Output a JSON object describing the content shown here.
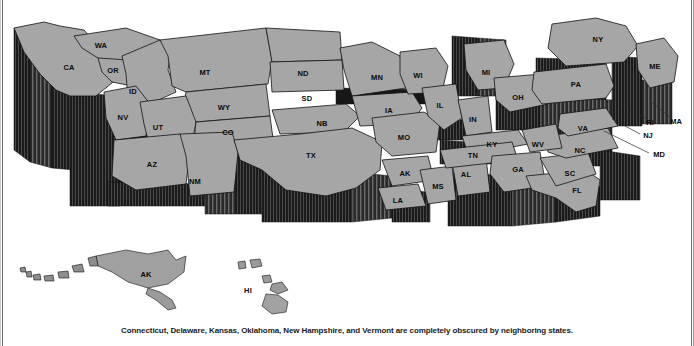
{
  "figure": {
    "caption": "Connecticut, Delaware, Kansas, Oklahoma, New Hampshire, and Vermont are completely obscured by neighboring states.",
    "colors": {
      "state_top_fill": "#a6a6a6",
      "state_side_dark": "#1c1c1c",
      "state_side_mid": "#555555",
      "outline": "#111111",
      "background": "#ffffff",
      "label_text": "#0a0a0a",
      "frame_rule": "#6e6e6e"
    }
  },
  "map": {
    "projection_note": "3D extruded prism map, viewed from the south at a low angle",
    "mainland_labels": [
      {
        "abbr": "WA",
        "x": 101,
        "y": 46
      },
      {
        "abbr": "OR",
        "x": 113,
        "y": 71
      },
      {
        "abbr": "CA",
        "x": 69,
        "y": 68
      },
      {
        "abbr": "ID",
        "x": 133,
        "y": 92
      },
      {
        "abbr": "NV",
        "x": 123,
        "y": 118
      },
      {
        "abbr": "MT",
        "x": 205,
        "y": 73
      },
      {
        "abbr": "WY",
        "x": 224,
        "y": 108
      },
      {
        "abbr": "UT",
        "x": 158,
        "y": 128
      },
      {
        "abbr": "AZ",
        "x": 152,
        "y": 165
      },
      {
        "abbr": "NM",
        "x": 195,
        "y": 182
      },
      {
        "abbr": "CO",
        "x": 228,
        "y": 133
      },
      {
        "abbr": "ND",
        "x": 303,
        "y": 74
      },
      {
        "abbr": "SD",
        "x": 307,
        "y": 99
      },
      {
        "abbr": "NB",
        "x": 322,
        "y": 124
      },
      {
        "abbr": "TX",
        "x": 311,
        "y": 156
      },
      {
        "abbr": "MN",
        "x": 377,
        "y": 78
      },
      {
        "abbr": "IA",
        "x": 389,
        "y": 111
      },
      {
        "abbr": "MO",
        "x": 404,
        "y": 138
      },
      {
        "abbr": "AK",
        "x": 405,
        "y": 174
      },
      {
        "abbr": "LA",
        "x": 398,
        "y": 201
      },
      {
        "abbr": "MS",
        "x": 438,
        "y": 187
      },
      {
        "abbr": "AL",
        "x": 466,
        "y": 175
      },
      {
        "abbr": "WI",
        "x": 418,
        "y": 76
      },
      {
        "abbr": "IL",
        "x": 440,
        "y": 106
      },
      {
        "abbr": "MI",
        "x": 486,
        "y": 73
      },
      {
        "abbr": "IN",
        "x": 473,
        "y": 120
      },
      {
        "abbr": "KY",
        "x": 492,
        "y": 145
      },
      {
        "abbr": "TN",
        "x": 473,
        "y": 156
      },
      {
        "abbr": "GA",
        "x": 518,
        "y": 170
      },
      {
        "abbr": "FL",
        "x": 577,
        "y": 191
      },
      {
        "abbr": "SC",
        "x": 570,
        "y": 174
      },
      {
        "abbr": "NC",
        "x": 580,
        "y": 151
      },
      {
        "abbr": "WV",
        "x": 538,
        "y": 145
      },
      {
        "abbr": "VA",
        "x": 583,
        "y": 129
      },
      {
        "abbr": "OH",
        "x": 518,
        "y": 98
      },
      {
        "abbr": "PA",
        "x": 576,
        "y": 85
      },
      {
        "abbr": "NY",
        "x": 598,
        "y": 40
      },
      {
        "abbr": "ME",
        "x": 655,
        "y": 67
      }
    ],
    "callouts": [
      {
        "abbr": "RI",
        "x": 650,
        "y": 123,
        "leader": [
          [
            645,
            118
          ],
          [
            622,
            104
          ]
        ]
      },
      {
        "abbr": "MA",
        "x": 676,
        "y": 122,
        "leader": [
          [
            670,
            117
          ],
          [
            650,
            101
          ]
        ]
      },
      {
        "abbr": "NJ",
        "x": 648,
        "y": 136,
        "leader": [
          [
            640,
            134
          ],
          [
            612,
            119
          ]
        ]
      },
      {
        "abbr": "MD",
        "x": 659,
        "y": 155,
        "leader": [
          [
            649,
            153
          ],
          [
            604,
            131
          ]
        ]
      }
    ],
    "insets": [
      {
        "abbr": "AK",
        "name": "Alaska",
        "x": 146,
        "y": 275
      },
      {
        "abbr": "HI",
        "name": "Hawaii",
        "x": 248,
        "y": 291
      }
    ],
    "obscured_states": [
      "Connecticut",
      "Delaware",
      "Kansas",
      "Oklahoma",
      "New Hampshire",
      "Vermont"
    ]
  }
}
